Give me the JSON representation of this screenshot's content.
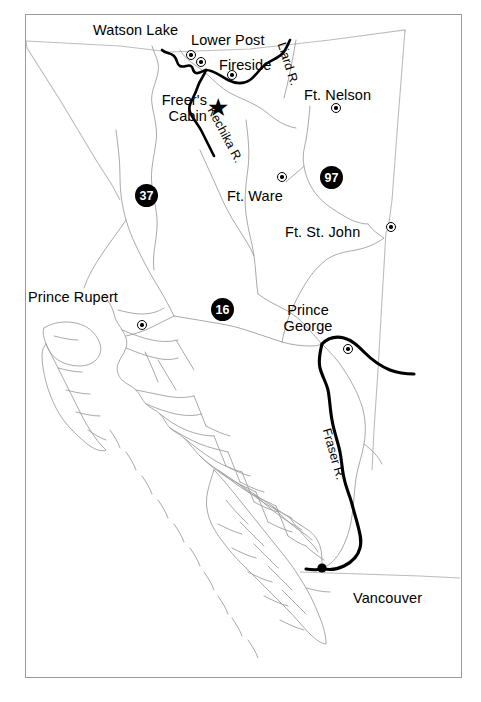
{
  "map": {
    "region": "British Columbia",
    "background_color": "#ffffff",
    "frame_color": "#9a9a9a",
    "boundary_color": "#b7b7b7",
    "coastline_color": "#8c8c8c",
    "route_color": "#000000",
    "label_color": "#000000",
    "shield_fill": "#000000",
    "shield_text_color": "#ffffff",
    "places": [
      {
        "id": "watson-lake",
        "label": "Watson Lake",
        "label_x": 92,
        "label_y": 22,
        "dot_x": 165,
        "dot_y": 50
      },
      {
        "id": "lower-post",
        "label": "Lower Post",
        "label_x": 190,
        "label_y": 32,
        "dot_x": 175,
        "dot_y": 57
      },
      {
        "id": "fireside",
        "label": "Fireside",
        "label_x": 218,
        "label_y": 57,
        "dot_x": 206,
        "dot_y": 70
      },
      {
        "id": "ft-nelson",
        "label": "Ft. Nelson",
        "label_x": 303,
        "label_y": 87,
        "dot_x": 310,
        "dot_y": 103
      },
      {
        "id": "freers-cabin",
        "label": "Freer's\nCabin",
        "label_x": 148,
        "label_y": 92,
        "dot_x": null,
        "dot_y": null
      },
      {
        "id": "ft-ware",
        "label": "Ft. Ware",
        "label_x": 226,
        "label_y": 188,
        "dot_x": 256,
        "dot_y": 172
      },
      {
        "id": "ft-st-john",
        "label": "Ft. St. John",
        "label_x": 284,
        "label_y": 224,
        "dot_x": 365,
        "dot_y": 222
      },
      {
        "id": "prince-rupert",
        "label": "Prince Rupert",
        "label_x": 27,
        "label_y": 289,
        "dot_x": 116,
        "dot_y": 320
      },
      {
        "id": "prince-george",
        "label": "Prince\nGeorge",
        "label_x": 273,
        "label_y": 302,
        "dot_x": 322,
        "dot_y": 344
      },
      {
        "id": "vancouver",
        "label": "Vancouver",
        "label_x": 352,
        "label_y": 590,
        "dot_x": 322,
        "dot_y": 568
      }
    ],
    "rivers": [
      {
        "id": "liard-river",
        "label": "Liard R.",
        "label_x": 285,
        "label_y": 43,
        "rotate": 72
      },
      {
        "id": "kechika-river",
        "label": "Kechika R.",
        "label_x": 215,
        "label_y": 106,
        "rotate": 62
      },
      {
        "id": "fraser-river",
        "label": "Fraser R.",
        "label_x": 331,
        "label_y": 427,
        "rotate": 74
      }
    ],
    "highways": [
      {
        "id": "highway-37",
        "number": "37",
        "x": 120,
        "y": 180
      },
      {
        "id": "highway-97",
        "number": "97",
        "x": 305,
        "y": 162
      },
      {
        "id": "highway-16",
        "number": "16",
        "x": 196,
        "y": 294
      }
    ],
    "markers": [
      {
        "id": "freers-cabin-star",
        "symbol": "star",
        "glyph": "★",
        "x": 190,
        "y": 93
      }
    ]
  }
}
